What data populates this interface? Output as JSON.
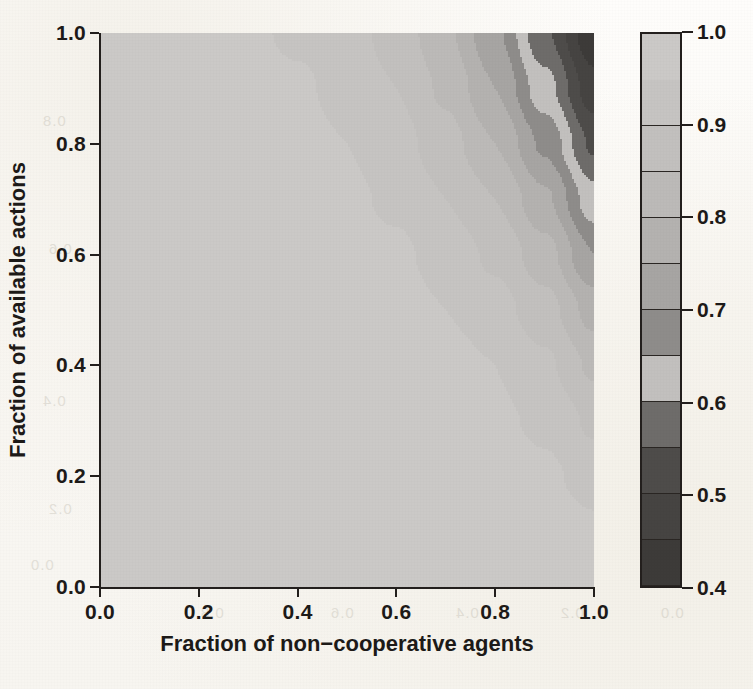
{
  "figure": {
    "kind": "filled-contour-plot",
    "paper_color": "#faf8f4",
    "ink_color": "#1d1a18"
  },
  "axes": {
    "x": {
      "label": "Fraction of non−cooperative agents",
      "ticks": [
        "0.0",
        "0.2",
        "0.4",
        "0.6",
        "0.8",
        "1.0"
      ],
      "tick_values": [
        0.0,
        0.2,
        0.4,
        0.6,
        0.8,
        1.0
      ],
      "range": [
        0.0,
        1.0
      ]
    },
    "y": {
      "label": "Fraction of available actions",
      "ticks": [
        "0.0",
        "0.2",
        "0.4",
        "0.6",
        "0.8",
        "1.0"
      ],
      "tick_values": [
        0.0,
        0.2,
        0.4,
        0.6,
        0.8,
        1.0
      ],
      "range": [
        0.0,
        1.0
      ]
    }
  },
  "colorbar": {
    "orientation": "vertical",
    "range": [
      0.4,
      1.0
    ],
    "tick_labels": [
      "0.4",
      "0.5",
      "0.6",
      "0.7",
      "0.8",
      "0.9",
      "1.0"
    ],
    "tick_values": [
      0.4,
      0.5,
      0.6,
      0.7,
      0.8,
      0.9,
      1.0
    ],
    "band_edges": [
      0.4,
      0.45,
      0.5,
      0.55,
      0.6,
      0.65,
      0.7,
      0.75,
      0.8,
      0.85,
      0.9,
      0.95,
      1.0
    ],
    "band_colors": [
      "#3d3b39",
      "#464442",
      "#4e4c4a",
      "#6e6c6a",
      "#c2c0be",
      "#8e8c8a",
      "#a7a5a3",
      "#b4b2b0",
      "#bcbab8",
      "#c2c0be",
      "#c6c4c2",
      "#cbc9c7"
    ]
  },
  "chart_data": {
    "type": "heatmap",
    "title": "",
    "xlabel": "Fraction of non−cooperative agents",
    "ylabel": "Fraction of available actions",
    "xlim": [
      0.0,
      1.0
    ],
    "ylim": [
      0.0,
      1.0
    ],
    "grid": false,
    "legend": "colorbar-right",
    "zlim": [
      0.4,
      1.0
    ],
    "z_levels": [
      0.4,
      0.45,
      0.5,
      0.55,
      0.6,
      0.65,
      0.7,
      0.75,
      0.8,
      0.85,
      0.9,
      0.95,
      1.0
    ],
    "x": [
      0.0,
      0.1,
      0.2,
      0.3,
      0.4,
      0.5,
      0.6,
      0.7,
      0.8,
      0.9,
      1.0
    ],
    "y": [
      0.0,
      0.1,
      0.2,
      0.3,
      0.4,
      0.5,
      0.6,
      0.7,
      0.8,
      0.9,
      1.0
    ],
    "z": [
      [
        1.0,
        1.0,
        1.0,
        1.0,
        1.0,
        1.0,
        1.0,
        1.0,
        0.99,
        0.99,
        0.98
      ],
      [
        1.0,
        1.0,
        1.0,
        1.0,
        1.0,
        1.0,
        1.0,
        0.99,
        0.99,
        0.98,
        0.96
      ],
      [
        1.0,
        1.0,
        1.0,
        1.0,
        1.0,
        1.0,
        0.99,
        0.99,
        0.98,
        0.96,
        0.93
      ],
      [
        1.0,
        1.0,
        1.0,
        1.0,
        1.0,
        0.99,
        0.99,
        0.98,
        0.96,
        0.94,
        0.89
      ],
      [
        1.0,
        1.0,
        1.0,
        1.0,
        0.99,
        0.99,
        0.98,
        0.97,
        0.95,
        0.91,
        0.84
      ],
      [
        1.0,
        1.0,
        1.0,
        0.99,
        0.99,
        0.98,
        0.97,
        0.95,
        0.92,
        0.87,
        0.78
      ],
      [
        1.0,
        1.0,
        0.99,
        0.99,
        0.98,
        0.97,
        0.96,
        0.93,
        0.89,
        0.82,
        0.7
      ],
      [
        1.0,
        0.99,
        0.99,
        0.98,
        0.97,
        0.96,
        0.94,
        0.9,
        0.85,
        0.76,
        0.62
      ],
      [
        0.99,
        0.99,
        0.98,
        0.98,
        0.97,
        0.95,
        0.92,
        0.87,
        0.8,
        0.69,
        0.54
      ],
      [
        0.99,
        0.99,
        0.98,
        0.97,
        0.96,
        0.93,
        0.9,
        0.84,
        0.75,
        0.62,
        0.47
      ],
      [
        0.99,
        0.98,
        0.97,
        0.96,
        0.94,
        0.92,
        0.88,
        0.81,
        0.71,
        0.56,
        0.41
      ]
    ]
  },
  "ghost_text": {
    "a": "0.8",
    "b": "0.6",
    "c": "0.4",
    "d": "0.2",
    "e": "0.0",
    "f": "0.8",
    "g": "0.6",
    "h": "0.4",
    "i": "0.2",
    "j": "0.0"
  }
}
